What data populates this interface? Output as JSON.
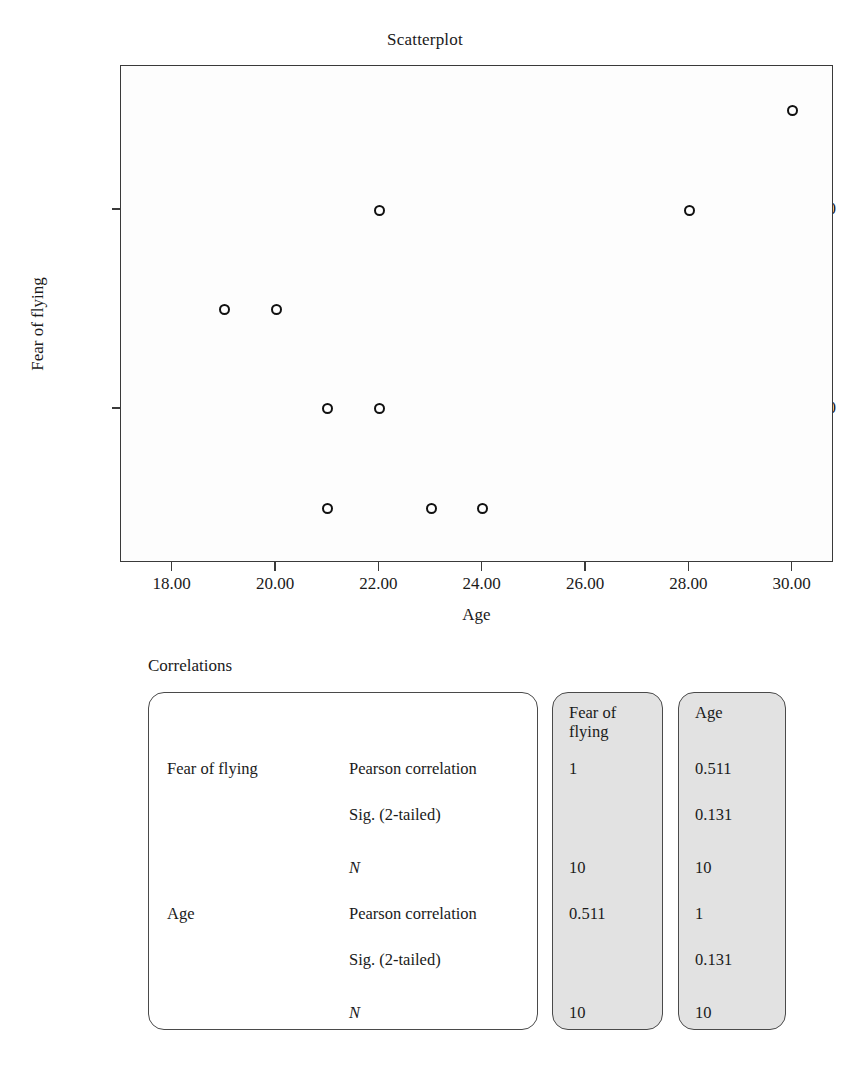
{
  "chart_data": {
    "type": "scatter",
    "title": "Scatterplot",
    "xlabel": "Age",
    "ylabel": "Fear of flying",
    "xlim": [
      17.0,
      30.8
    ],
    "ylim": [
      0.45,
      5.45
    ],
    "xticks": [
      "18.00",
      "20.00",
      "22.00",
      "24.00",
      "26.00",
      "28.00",
      "30.00"
    ],
    "xtick_values": [
      18,
      20,
      22,
      24,
      26,
      28,
      30
    ],
    "yticks": [
      "4.00",
      "2.00"
    ],
    "ytick_values": [
      4,
      2
    ],
    "grid": false,
    "legend": null,
    "marker": "open-circle",
    "points": [
      {
        "x": 19,
        "y": 3
      },
      {
        "x": 20,
        "y": 3
      },
      {
        "x": 21,
        "y": 2
      },
      {
        "x": 22,
        "y": 2
      },
      {
        "x": 22,
        "y": 4
      },
      {
        "x": 21,
        "y": 1
      },
      {
        "x": 23,
        "y": 1
      },
      {
        "x": 24,
        "y": 1
      },
      {
        "x": 28,
        "y": 4
      },
      {
        "x": 30,
        "y": 5
      }
    ]
  },
  "table": {
    "caption": "Correlations",
    "column_headers": [
      "Fear of flying",
      "Age"
    ],
    "rows": [
      {
        "variable": "Fear of flying",
        "statistic": "Pearson correlation",
        "italic": false,
        "values": [
          "1",
          "0.511"
        ]
      },
      {
        "variable": "",
        "statistic": "Sig. (2-tailed)",
        "italic": false,
        "values": [
          "",
          "0.131"
        ]
      },
      {
        "variable": "",
        "statistic": "N",
        "italic": true,
        "values": [
          "10",
          "10"
        ]
      },
      {
        "variable": "Age",
        "statistic": "Pearson correlation",
        "italic": false,
        "values": [
          "0.511",
          "1"
        ]
      },
      {
        "variable": "",
        "statistic": "Sig. (2-tailed)",
        "italic": false,
        "values": [
          "",
          "0.131"
        ]
      },
      {
        "variable": "",
        "statistic": "N",
        "italic": true,
        "values": [
          "10",
          "10"
        ]
      }
    ]
  },
  "colors": {
    "panel_gray": "#e2e2e2",
    "ink": "#1a1a1a",
    "axis": "#3a3a3a"
  }
}
